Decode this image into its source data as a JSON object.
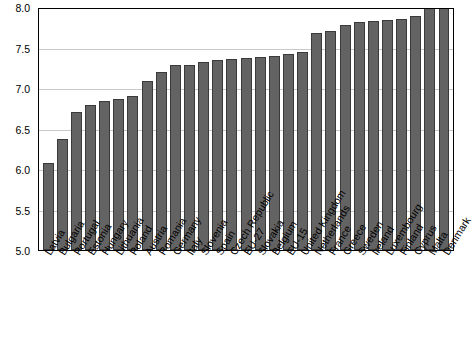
{
  "chart_data": {
    "type": "bar",
    "title": "",
    "subtitle": "",
    "xlabel": "",
    "ylabel": "",
    "ylim": [
      5.0,
      8.0
    ],
    "yticks": [
      "5.0",
      "5.5",
      "6.0",
      "6.5",
      "7.0",
      "7.5",
      "8.0"
    ],
    "grid": true,
    "legend": false,
    "bar_color": "#636363",
    "bar_edge_color": "#3a3a3a",
    "categories": [
      "Latvia",
      "Bulgaria",
      "Portugal",
      "Estonia",
      "Hungary",
      "Lithuania",
      "Poland",
      "Austria",
      "Romania",
      "Germany",
      "Italy",
      "Slovenia",
      "Spain",
      "Czech Republic",
      "EU-27",
      "Slovakia",
      "Belgium",
      "EU-15",
      "United Kingdom",
      "Netherlands",
      "France",
      "Greece",
      "Sweden",
      "Ireland",
      "Luxembourg",
      "Finland",
      "Cyprus",
      "Malta",
      "Denmark"
    ],
    "values": [
      6.08,
      6.37,
      6.71,
      6.79,
      6.84,
      6.86,
      6.9,
      7.09,
      7.2,
      7.29,
      7.29,
      7.32,
      7.35,
      7.36,
      7.37,
      7.38,
      7.4,
      7.42,
      7.45,
      7.68,
      7.71,
      7.78,
      7.82,
      7.83,
      7.84,
      7.85,
      7.89,
      8.0,
      8.0
    ]
  }
}
